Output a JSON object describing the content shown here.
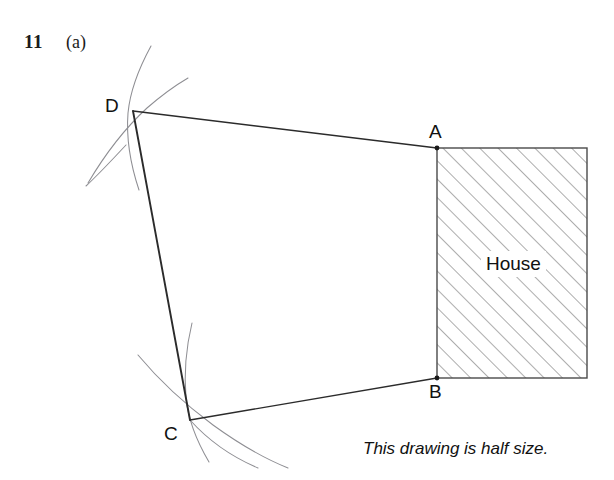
{
  "question": {
    "number": "11",
    "part": "(a)"
  },
  "caption": "This drawing is half size.",
  "labels": {
    "D": "D",
    "A": "A",
    "B": "B",
    "C": "C",
    "house": "House"
  },
  "colors": {
    "ink": "#1a1a1a",
    "construction_arc": "#8e8e93",
    "hatch": "#6f6f6f",
    "outline": "#4a4a4a",
    "background": "#ffffff"
  },
  "geometry": {
    "points": {
      "D": {
        "x": 133,
        "y": 111
      },
      "A": {
        "x": 437,
        "y": 148
      },
      "B": {
        "x": 437,
        "y": 378
      },
      "C": {
        "x": 190,
        "y": 420
      }
    },
    "house_rect": {
      "x": 437,
      "y": 148,
      "width": 150,
      "height": 230
    },
    "hatch_angle_deg": 45,
    "hatch_spacing_px": 13,
    "quadrilateral_order": [
      "D",
      "A",
      "B",
      "C"
    ],
    "construction_arcs_at": [
      "D",
      "C"
    ]
  }
}
